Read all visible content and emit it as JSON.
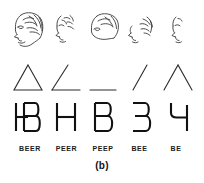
{
  "figure": {
    "caption": "(b)"
  },
  "rows": {
    "faces": {
      "name": "face-profiles-row",
      "items": [
        {
          "id": "face-1",
          "alt": "complete left-facing profile with hair, eye, nose, mouth and chin"
        },
        {
          "id": "face-2",
          "alt": "partial profile fragments: brow, eye, nose and chin only"
        },
        {
          "id": "face-3",
          "alt": "head outline with hair contour, no facial features"
        },
        {
          "id": "face-4",
          "alt": "scattered profile fragments, nose and hair strokes"
        },
        {
          "id": "face-5",
          "alt": "minimal profile fragment: nose and lip strokes"
        }
      ]
    },
    "shapes": {
      "name": "line-figures-row",
      "items": [
        {
          "id": "shape-triangle",
          "glyph": "triangle",
          "alt": "closed triangle"
        },
        {
          "id": "shape-angle",
          "glyph": "angle",
          "alt": "open angle, two sides"
        },
        {
          "id": "shape-line",
          "glyph": "horizontal-line",
          "alt": "single horizontal line"
        },
        {
          "id": "shape-slash",
          "glyph": "slash",
          "alt": "single oblique line"
        },
        {
          "id": "shape-caret",
          "glyph": "caret",
          "alt": "inverted V, two oblique lines"
        }
      ]
    },
    "letters": {
      "name": "letter-forms-row",
      "items": [
        {
          "id": "letter-hb",
          "glyph": "HB",
          "alt": "overlapping H and B"
        },
        {
          "id": "letter-h",
          "glyph": "H",
          "alt": "letter H"
        },
        {
          "id": "letter-b",
          "glyph": "B",
          "alt": "letter B"
        },
        {
          "id": "letter-3",
          "glyph": "3",
          "alt": "reversed E resembling digit 3"
        },
        {
          "id": "letter-4",
          "glyph": "4",
          "alt": "open-top 4 form"
        }
      ]
    },
    "labels": {
      "name": "word-labels-row",
      "items": [
        {
          "id": "label-beer",
          "text": "BEER"
        },
        {
          "id": "label-peer",
          "text": "PEER"
        },
        {
          "id": "label-peep",
          "text": "PEEP"
        },
        {
          "id": "label-bee",
          "text": "BEE"
        },
        {
          "id": "label-be",
          "text": "BE"
        }
      ]
    }
  },
  "colors": {
    "ink": "#111111",
    "sketch": "#3a3a3a",
    "background": "#ffffff"
  }
}
